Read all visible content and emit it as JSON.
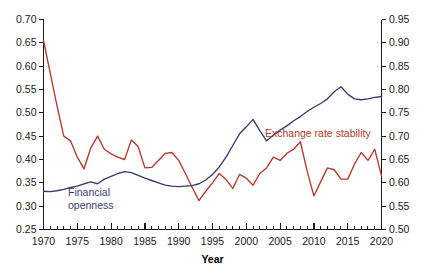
{
  "chart_data": {
    "type": "line",
    "title": "",
    "subtitle": "",
    "xlabel": "Year",
    "ylabel": "",
    "y2label": "",
    "xlim": [
      1970,
      2020
    ],
    "ylim": [
      0.25,
      0.7
    ],
    "y2lim": [
      0.5,
      0.95
    ],
    "grid": false,
    "legend_position": "inline-annotation",
    "xticks": [
      1970,
      1975,
      1980,
      1985,
      1990,
      1995,
      2000,
      2005,
      2010,
      2015,
      2020
    ],
    "xtick_labels": [
      "1970",
      "1975",
      "1980",
      "1985",
      "1990",
      "1995",
      "2000",
      "2005",
      "2010",
      "2015",
      "2020"
    ],
    "x_minor_tick_step": 1,
    "yticks": [
      0.25,
      0.3,
      0.35,
      0.4,
      0.45,
      0.5,
      0.55,
      0.6,
      0.65,
      0.7
    ],
    "ytick_labels": [
      "0.25",
      "0.30",
      "0.35",
      "0.40",
      "0.45",
      "0.50",
      "0.55",
      "0.60",
      "0.65",
      "0.70"
    ],
    "y2ticks": [
      0.5,
      0.55,
      0.6,
      0.65,
      0.7,
      0.75,
      0.8,
      0.85,
      0.9,
      0.95
    ],
    "y2tick_labels": [
      "0.50",
      "0.55",
      "0.60",
      "0.65",
      "0.70",
      "0.75",
      "0.80",
      "0.85",
      "0.90",
      "0.95"
    ],
    "x": [
      1970,
      1971,
      1972,
      1973,
      1974,
      1975,
      1976,
      1977,
      1978,
      1979,
      1980,
      1981,
      1982,
      1983,
      1984,
      1985,
      1986,
      1987,
      1988,
      1989,
      1990,
      1991,
      1992,
      1993,
      1994,
      1995,
      1996,
      1997,
      1998,
      1999,
      2000,
      2001,
      2002,
      2003,
      2004,
      2005,
      2006,
      2007,
      2008,
      2009,
      2010,
      2011,
      2012,
      2013,
      2014,
      2015,
      2016,
      2017,
      2018,
      2019,
      2020
    ],
    "series": [
      {
        "name": "Exchange rate stability",
        "axis": "right",
        "color": "#b5392c",
        "label_text": "Exchange rate stability",
        "values": [
          0.905,
          0.835,
          0.765,
          0.7,
          0.69,
          0.655,
          0.63,
          0.675,
          0.7,
          0.672,
          0.662,
          0.655,
          0.65,
          0.692,
          0.678,
          0.632,
          0.633,
          0.648,
          0.663,
          0.665,
          0.648,
          0.62,
          0.59,
          0.562,
          0.582,
          0.6,
          0.62,
          0.607,
          0.588,
          0.618,
          0.61,
          0.595,
          0.62,
          0.632,
          0.655,
          0.648,
          0.663,
          0.672,
          0.688,
          0.625,
          0.572,
          0.602,
          0.632,
          0.628,
          0.608,
          0.608,
          0.64,
          0.665,
          0.648,
          0.672,
          0.615
        ]
      },
      {
        "name": "Financial openness",
        "axis": "left",
        "color": "#3a3a6e",
        "label_text_line1": "Financial",
        "label_text_line2": "openness",
        "values": [
          0.332,
          0.331,
          0.333,
          0.336,
          0.34,
          0.343,
          0.348,
          0.352,
          0.348,
          0.358,
          0.364,
          0.37,
          0.374,
          0.372,
          0.366,
          0.36,
          0.355,
          0.35,
          0.345,
          0.343,
          0.342,
          0.343,
          0.344,
          0.348,
          0.356,
          0.368,
          0.384,
          0.405,
          0.43,
          0.455,
          0.47,
          0.486,
          0.462,
          0.44,
          0.452,
          0.463,
          0.472,
          0.483,
          0.492,
          0.503,
          0.512,
          0.52,
          0.53,
          0.545,
          0.556,
          0.54,
          0.53,
          0.528,
          0.53,
          0.533,
          0.535
        ]
      }
    ]
  },
  "annotations": {
    "series_label_red": "Exchange rate stability",
    "series_label_blue_line1": "Financial",
    "series_label_blue_line2": "openness",
    "x_axis_title": "Year"
  },
  "colors": {
    "exchange_rate_stability": "#b5392c",
    "financial_openness": "#3a3a6e",
    "axis": "#1a1a1a",
    "background": "#ffffff"
  }
}
